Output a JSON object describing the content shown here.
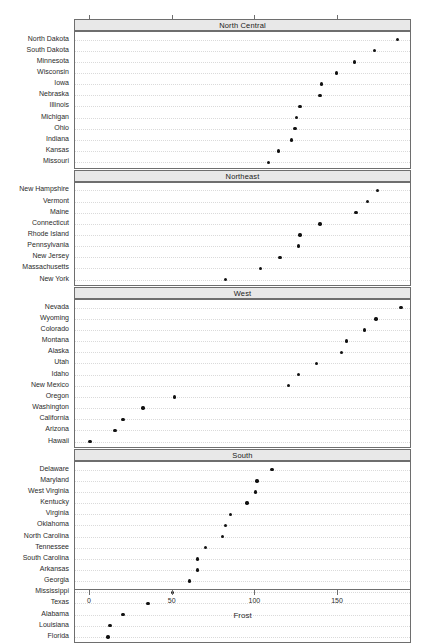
{
  "chart_data": {
    "type": "scatter",
    "plot_kind": "dotplot",
    "title": "",
    "xlabel": "Frost",
    "ylabel": "",
    "xlim": [
      -6,
      199
    ],
    "xticks": [
      0,
      50,
      100,
      150
    ],
    "xtick_labels": [
      "0",
      "50",
      "100",
      "150"
    ],
    "grid": "horizontal-dotted",
    "legend": "none",
    "faceted_by": "region",
    "panels": [
      {
        "strip_label": "North Central",
        "categories": [
          "North Dakota",
          "South Dakota",
          "Minnesota",
          "Wisconsin",
          "Iowa",
          "Nebraska",
          "Illinois",
          "Michigan",
          "Ohio",
          "Indiana",
          "Kansas",
          "Missouri"
        ],
        "values": [
          186,
          172,
          160,
          149,
          140,
          139,
          127,
          125,
          124,
          122,
          114,
          108
        ]
      },
      {
        "strip_label": "Northeast",
        "categories": [
          "New Hampshire",
          "Vermont",
          "Maine",
          "Connecticut",
          "Rhode Island",
          "Pennsylvania",
          "New Jersey",
          "Massachusetts",
          "New York"
        ],
        "values": [
          174,
          168,
          161,
          139,
          127,
          126,
          115,
          103,
          82
        ]
      },
      {
        "strip_label": "West",
        "categories": [
          "Nevada",
          "Wyoming",
          "Colorado",
          "Montana",
          "Alaska",
          "Utah",
          "Idaho",
          "New Mexico",
          "Oregon",
          "Washington",
          "California",
          "Arizona",
          "Hawaii"
        ],
        "values": [
          188,
          173,
          166,
          155,
          152,
          137,
          126,
          120,
          51,
          32,
          20,
          15,
          0
        ]
      },
      {
        "strip_label": "South",
        "categories": [
          "Delaware",
          "Maryland",
          "West Virginia",
          "Kentucky",
          "Virginia",
          "Oklahoma",
          "North Carolina",
          "Tennessee",
          "South Carolina",
          "Arkansas",
          "Georgia",
          "Mississippi",
          "Texas",
          "Alabama",
          "Louisiana",
          "Florida"
        ],
        "values": [
          110,
          101,
          100,
          95,
          85,
          82,
          80,
          70,
          65,
          65,
          60,
          50,
          35,
          20,
          12,
          11
        ]
      }
    ]
  },
  "axis": {
    "x_title": "Frost",
    "ticks": [
      "0",
      "50",
      "100",
      "150"
    ]
  },
  "colors": {
    "dot": "#111111",
    "frame": "#6e6e6e",
    "strip_bg": "#e8e8e8",
    "grid": "#dadada",
    "background": "#ffffff"
  }
}
